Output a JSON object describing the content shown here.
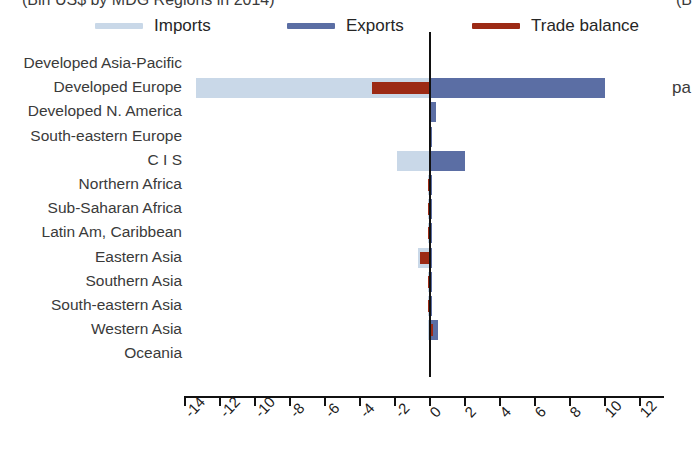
{
  "chart_data": {
    "type": "bar",
    "orientation": "horizontal",
    "title": "(Bln US$ by MDG Regions in 2014)",
    "title_right_fragment": "(B",
    "right_margin_fragment": "pa",
    "xlabel": "",
    "ylabel": "",
    "xlim": [
      -14,
      12
    ],
    "xticks": [
      -14,
      -12,
      -10,
      -8,
      -6,
      -4,
      -2,
      0,
      2,
      4,
      6,
      8,
      10,
      12
    ],
    "xtick_labels": [
      "-14",
      "-12",
      "-10",
      "-8",
      "-6",
      "-4",
      "-2",
      "0",
      "2",
      "4",
      "6",
      "8",
      "10",
      "12"
    ],
    "grid": false,
    "legend_position": "top",
    "categories": [
      "Developed Asia-Pacific",
      "Developed Europe",
      "Developed N. America",
      "South-eastern Europe",
      "C I S",
      "Northern Africa",
      "Sub-Saharan Africa",
      "Latin Am, Caribbean",
      "Eastern Asia",
      "Southern Asia",
      "South-eastern Asia",
      "Western Asia",
      "Oceania"
    ],
    "series": [
      {
        "name": "Imports",
        "color": "#c9d8e8",
        "values": [
          0.0,
          -13.4,
          0.0,
          0.0,
          -1.9,
          -0.05,
          -0.05,
          -0.05,
          -0.7,
          -0.05,
          -0.05,
          -0.1,
          0.0
        ]
      },
      {
        "name": "Exports",
        "color": "#5b6ea4",
        "values": [
          0.0,
          10.0,
          0.35,
          0.05,
          2.0,
          0.05,
          0.05,
          0.05,
          0.1,
          0.05,
          0.05,
          0.45,
          0.0
        ]
      },
      {
        "name": "Trade balance",
        "color": "#9c2a15",
        "values": [
          0.0,
          -3.3,
          0.0,
          0.0,
          0.0,
          -0.1,
          -0.1,
          -0.1,
          -0.6,
          -0.1,
          -0.1,
          0.15,
          0.0
        ]
      }
    ]
  },
  "legend": {
    "items": [
      {
        "label": "Imports",
        "color": "#c9d8e8"
      },
      {
        "label": "Exports",
        "color": "#5b6ea4"
      },
      {
        "label": "Trade balance",
        "color": "#9c2a15"
      }
    ]
  },
  "colors": {
    "imports": "#c9d8e8",
    "exports": "#5b6ea4",
    "balance": "#9c2a15",
    "axis": "#111111",
    "text": "#3a3a3a"
  }
}
